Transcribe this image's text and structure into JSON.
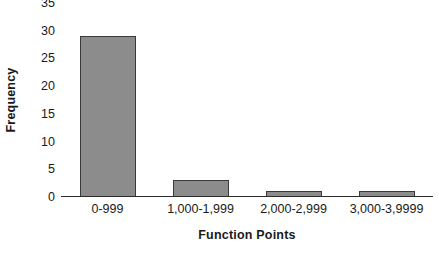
{
  "chart_data": {
    "type": "bar",
    "title": "",
    "subtitle": "",
    "xlabel": "Function Points",
    "ylabel": "Frequency",
    "categories": [
      "0-999",
      "1,000-1,999",
      "2,000-2,999",
      "3,000-3,9999"
    ],
    "values": [
      29,
      3,
      1,
      1
    ],
    "series": [
      {
        "name": "Frequency",
        "values": [
          29,
          3,
          1,
          1
        ]
      }
    ],
    "ylim": [
      0,
      35
    ],
    "ytick_step": 5,
    "ytick_labels": [
      "0",
      "5",
      "10",
      "15",
      "20",
      "25",
      "30",
      "35"
    ],
    "ytick_values": [
      0,
      5,
      10,
      15,
      20,
      25,
      30,
      35
    ],
    "grid": false,
    "legend": false,
    "legend_position": "none",
    "bar_fill_color": "#8c8c8c",
    "bar_border_color": "#3a3a3a",
    "axis_color": "#2b2b2b",
    "background_color": "#ffffff",
    "text_color": "#1a1a1a"
  }
}
